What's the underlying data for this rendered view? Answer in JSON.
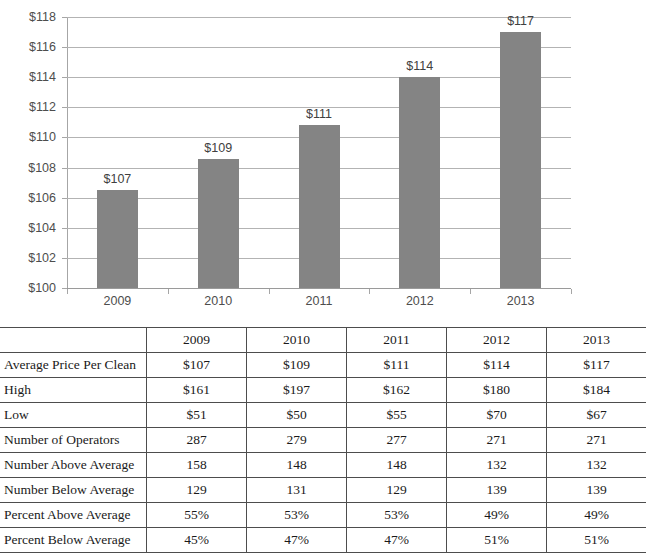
{
  "chart_data": {
    "type": "bar",
    "title": "",
    "xlabel": "",
    "ylabel": "",
    "categories": [
      "2009",
      "2010",
      "2011",
      "2012",
      "2013"
    ],
    "values": [
      106.5,
      108.6,
      110.8,
      114.0,
      117.0
    ],
    "data_labels": [
      "$107",
      "$109",
      "$111",
      "$114",
      "$117"
    ],
    "ylim": [
      100,
      118
    ],
    "ytick_values": [
      100,
      102,
      104,
      106,
      108,
      110,
      112,
      114,
      116,
      118
    ],
    "ytick_labels": [
      "$100",
      "$102",
      "$104",
      "$106",
      "$108",
      "$110",
      "$112",
      "$114",
      "$116",
      "$118"
    ],
    "grid": true,
    "legend": "none",
    "bar_color": "#848484",
    "gridline_color": "#b3b3b3",
    "axis_color": "#a6a6a6",
    "series": [
      {
        "name": "Average Price Per Clean",
        "values": [
          106.5,
          108.6,
          110.8,
          114.0,
          117.0
        ]
      }
    ]
  },
  "table": {
    "corner_label": "",
    "columns": [
      "2009",
      "2010",
      "2011",
      "2012",
      "2013"
    ],
    "rows": [
      {
        "label": "Average Price Per Clean",
        "values": [
          "$107",
          "$109",
          "$111",
          "$114",
          "$117"
        ]
      },
      {
        "label": "High",
        "values": [
          "$161",
          "$197",
          "$162",
          "$180",
          "$184"
        ]
      },
      {
        "label": "Low",
        "values": [
          "$51",
          "$50",
          "$55",
          "$70",
          "$67"
        ]
      },
      {
        "label": "Number of Operators",
        "values": [
          "287",
          "279",
          "277",
          "271",
          "271"
        ]
      },
      {
        "label": "Number Above Average",
        "values": [
          "158",
          "148",
          "148",
          "132",
          "132"
        ]
      },
      {
        "label": "Number Below Average",
        "values": [
          "129",
          "131",
          "129",
          "139",
          "139"
        ]
      },
      {
        "label": "Percent Above Average",
        "values": [
          "55%",
          "53%",
          "53%",
          "49%",
          "49%"
        ]
      },
      {
        "label": "Percent Below Average",
        "values": [
          "45%",
          "47%",
          "47%",
          "51%",
          "51%"
        ]
      }
    ]
  }
}
